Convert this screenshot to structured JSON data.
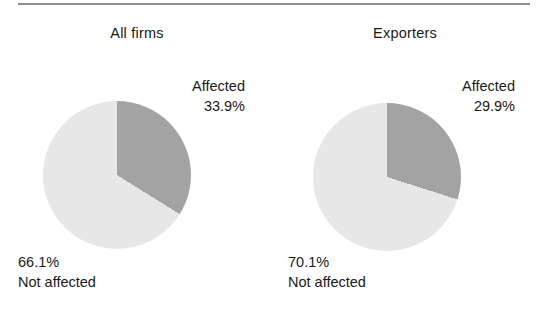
{
  "figure": {
    "background": "#ffffff",
    "rule_color": "#8d8d8d",
    "text_color": "#1a1a1a"
  },
  "panels": [
    {
      "title": "All firms",
      "affected_label": "Affected",
      "affected_value": "33.9%",
      "not_affected_label": "Not affected",
      "not_affected_value": "66.1%"
    },
    {
      "title": "Exporters",
      "affected_label": "Affected",
      "affected_value": "29.9%",
      "not_affected_label": "Not affected",
      "not_affected_value": "70.1%"
    }
  ],
  "chart_data": [
    {
      "type": "pie",
      "title": "All firms",
      "labels": [
        "Affected",
        "Not affected"
      ],
      "values": [
        33.9,
        66.1
      ],
      "value_labels": [
        "33.9%",
        "66.1%"
      ],
      "colors": [
        "#a3a3a3",
        "#e7e7e7"
      ],
      "start_angle_deg": 0,
      "direction": "clockwise",
      "legend": "callouts",
      "grid": false
    },
    {
      "type": "pie",
      "title": "Exporters",
      "labels": [
        "Affected",
        "Not affected"
      ],
      "values": [
        29.9,
        70.1
      ],
      "value_labels": [
        "29.9%",
        "70.1%"
      ],
      "colors": [
        "#a3a3a3",
        "#e7e7e7"
      ],
      "start_angle_deg": 0,
      "direction": "clockwise",
      "legend": "callouts",
      "grid": false
    }
  ]
}
